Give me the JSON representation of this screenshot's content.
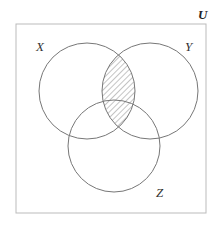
{
  "diagram": {
    "type": "venn-3-set",
    "universe": {
      "label": "U",
      "x": 16,
      "y": 24,
      "width": 190,
      "height": 189,
      "stroke": "#bbbbbb"
    },
    "sets": [
      {
        "id": "X",
        "label": "X",
        "cx": 87,
        "cy": 91,
        "r": 48,
        "label_x": 36,
        "label_y": 51
      },
      {
        "id": "Y",
        "label": "Y",
        "cx": 150,
        "cy": 91,
        "r": 48,
        "label_x": 185,
        "label_y": 51
      },
      {
        "id": "Z",
        "label": "Z",
        "cx": 114,
        "cy": 146,
        "r": 46,
        "label_x": 156,
        "label_y": 197
      }
    ],
    "shaded_region": {
      "expression": "X ∩ Y",
      "pattern": "diagonal-hatch",
      "color": "#888888"
    },
    "circle_stroke": "#777777",
    "u_label_pos": {
      "x": 198,
      "y": 19
    }
  }
}
